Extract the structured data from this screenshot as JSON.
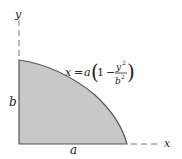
{
  "diagram": {
    "axes": {
      "x_label": "x",
      "y_label": "y"
    },
    "dimensions": {
      "width_label": "a",
      "height_label": "b"
    },
    "equation": {
      "lhs": "x",
      "eq": "=",
      "coef": "a",
      "one": "1",
      "minus": "−",
      "num_var": "y",
      "num_exp": "2",
      "den_var": "b",
      "den_exp": "2"
    },
    "colors": {
      "fill": "#c8c8c8",
      "stroke": "#555555",
      "axis": "#666666"
    }
  }
}
